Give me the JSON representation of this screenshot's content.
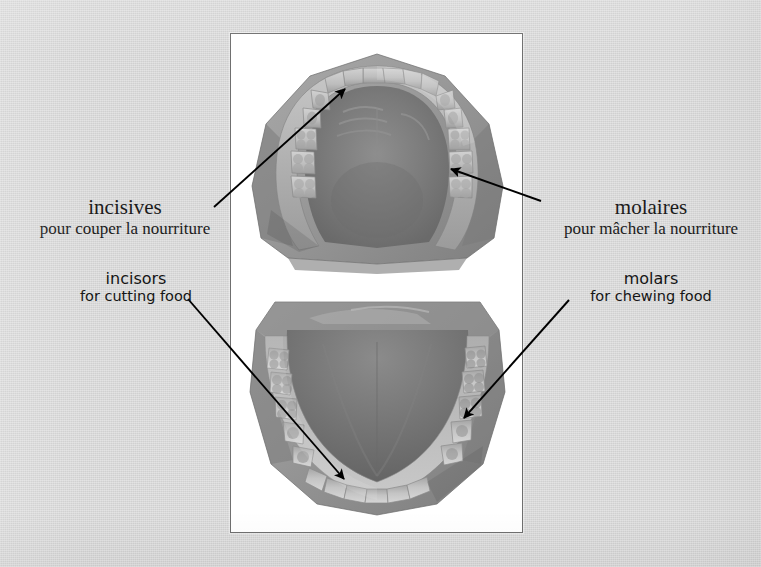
{
  "page": {
    "background_color": "#d6d6d6",
    "kind": "bilingual-anatomy-plate"
  },
  "photo": {
    "frame_border_color": "#6f6f6f",
    "frame_background": "#ffffff",
    "upper_cast_name": "upper-jaw-dental-cast",
    "lower_cast_name": "lower-jaw-dental-cast"
  },
  "labels": {
    "french_left": {
      "term": "incisives",
      "description": "pour couper la nourriture"
    },
    "french_right": {
      "term": "molaires",
      "description": "pour mâcher la nourriture"
    },
    "english_left": {
      "term": "incisors",
      "description": "for cutting food"
    },
    "english_right": {
      "term": "molars",
      "description": "for chewing food"
    }
  },
  "arrows": {
    "color": "#000000",
    "incisives_target": "upper-front-teeth",
    "molaires_target": "upper-back-teeth",
    "incisors_target": "lower-front-teeth",
    "molars_target": "lower-back-teeth"
  }
}
